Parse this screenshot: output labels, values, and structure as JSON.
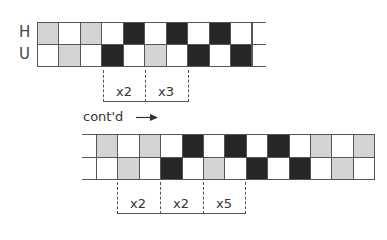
{
  "colors": {
    "gray": "#d4d4d4",
    "black": "#262626",
    "white": "#ffffff",
    "line": "#555555"
  },
  "top_chart": {
    "row_labels": [
      "H",
      "U"
    ],
    "rows": [
      [
        "gray",
        "white",
        "gray",
        "white",
        "black",
        "white",
        "black",
        "white",
        "black",
        "white",
        "white"
      ],
      [
        "white",
        "gray",
        "white",
        "black",
        "white",
        "gray",
        "white",
        "black",
        "white",
        "black",
        "white"
      ]
    ],
    "repeats": [
      "x2",
      "x3"
    ]
  },
  "continuation_label": "cont'd",
  "continuation_arrow": "arrow-right-icon",
  "bottom_chart": {
    "rows": [
      [
        "white",
        "gray",
        "white",
        "gray",
        "white",
        "black",
        "white",
        "black",
        "white",
        "black",
        "white",
        "gray",
        "white",
        "gray"
      ],
      [
        "white",
        "white",
        "gray",
        "white",
        "black",
        "white",
        "gray",
        "white",
        "black",
        "white",
        "black",
        "white",
        "gray",
        "white"
      ]
    ],
    "repeats": [
      "x2",
      "x2",
      "x5"
    ]
  }
}
